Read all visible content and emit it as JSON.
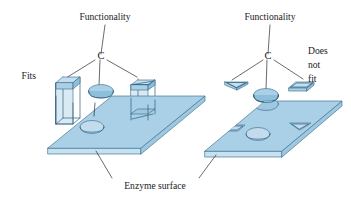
{
  "figure": {
    "title_alt": "Enzyme surface lock-and-key functionality diagram",
    "labels": {
      "functionality_left": "Functionality",
      "functionality_right": "Functionality",
      "c_left": "C",
      "c_right": "C",
      "fits": "Fits",
      "does": "Does",
      "not": "not",
      "fit": "fit",
      "enzyme_surface": "Enzyme surface"
    },
    "panels": [
      {
        "id": "left-panel",
        "name": "fitting-substrate-panel",
        "caption": "Fits",
        "surface_label": "Enzyme surface",
        "functionality_label": "Functionality",
        "center_atom": "C",
        "substrates": [
          {
            "name": "square-prism-substrate",
            "shape": "square-prism",
            "fits": true
          },
          {
            "name": "circular-plug-substrate",
            "shape": "circle",
            "fits": true
          },
          {
            "name": "triangular-prism-substrate",
            "shape": "triangular-prism",
            "fits": true
          }
        ],
        "surface_holes": [
          {
            "name": "square-hole",
            "shape": "square"
          },
          {
            "name": "circular-hole",
            "shape": "circle"
          },
          {
            "name": "triangular-hole",
            "shape": "triangle"
          }
        ]
      },
      {
        "id": "right-panel",
        "name": "nonfitting-substrate-panel",
        "caption": "Does not fit",
        "functionality_label": "Functionality",
        "center_atom": "C",
        "substrates": [
          {
            "name": "flat-triangle-substrate",
            "shape": "flat-triangle",
            "fits": false
          },
          {
            "name": "circular-plug-substrate",
            "shape": "circle",
            "fits": false
          },
          {
            "name": "flat-slab-substrate",
            "shape": "flat-parallelogram",
            "fits": false
          }
        ],
        "surface_holes": [
          {
            "name": "parallelogram-hole",
            "shape": "parallelogram"
          },
          {
            "name": "circular-hole",
            "shape": "circle"
          },
          {
            "name": "triangular-hole",
            "shape": "triangle"
          }
        ]
      }
    ],
    "colors": {
      "surface_fill": "#a9d0e6",
      "surface_edge_fill": "#c7e1f1",
      "shape_fill": "#a9d0e6",
      "shape_top_fill": "#c4def0",
      "outline": "#3c6f8e",
      "leader_line": "#2b2b2b",
      "text": "#1a1a1a",
      "background": "#ffffff"
    }
  }
}
